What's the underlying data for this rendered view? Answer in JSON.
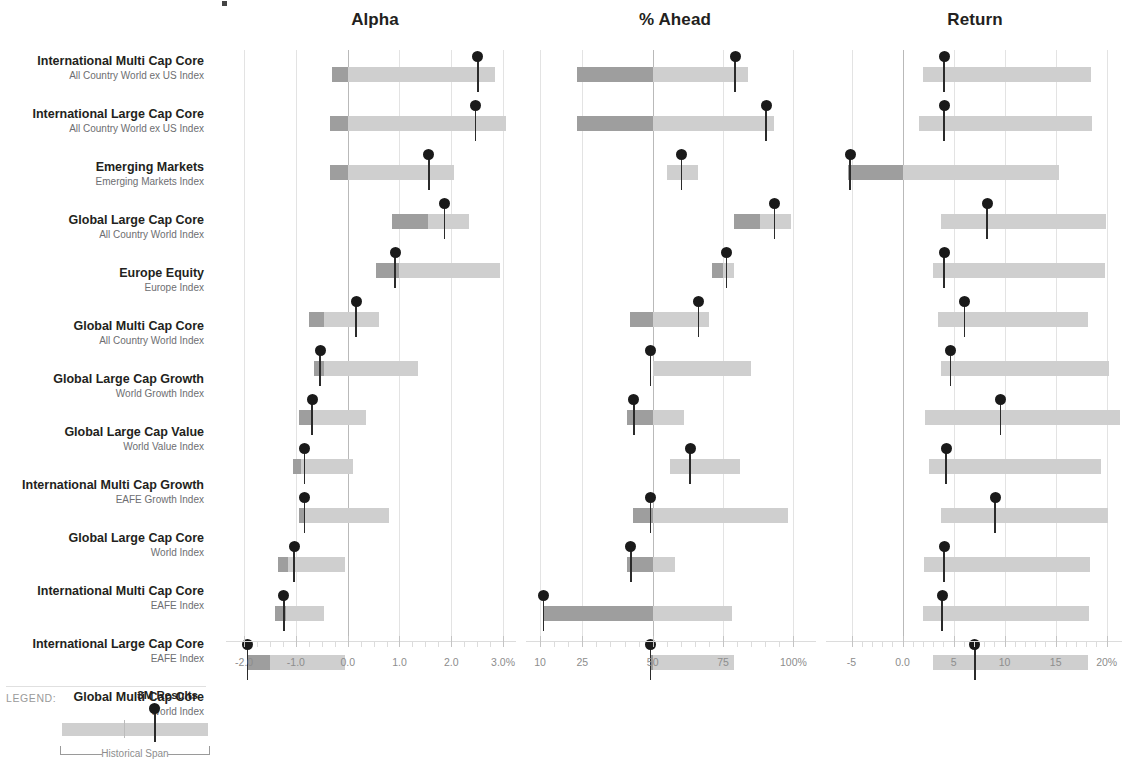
{
  "columns": [
    {
      "key": "alpha",
      "header": "Alpha",
      "unit": "%",
      "min": -2.35,
      "max": 3.25,
      "ticks": [
        {
          "v": -2.0,
          "label": "-2.0"
        },
        {
          "v": -1.0,
          "label": "-1.0"
        },
        {
          "v": 0.0,
          "label": "0.0"
        },
        {
          "v": 1.0,
          "label": "1.0"
        },
        {
          "v": 2.0,
          "label": "2.0"
        },
        {
          "v": 3.0,
          "label": "3.0%"
        }
      ],
      "reference": 0.0,
      "minor_step": 0.25
    },
    {
      "key": "ahead",
      "header": "% Ahead",
      "unit": "%",
      "min": 5,
      "max": 108,
      "ticks": [
        {
          "v": 10,
          "label": "10"
        },
        {
          "v": 25,
          "label": "25"
        },
        {
          "v": 50,
          "label": "50"
        },
        {
          "v": 75,
          "label": "75"
        },
        {
          "v": 100,
          "label": "100%"
        }
      ],
      "reference": 50,
      "minor_step": 5
    },
    {
      "key": "return",
      "header": "Return",
      "unit": "%",
      "min": -7.5,
      "max": 21.5,
      "ticks": [
        {
          "v": -5,
          "label": "-5"
        },
        {
          "v": 0,
          "label": "0.0"
        },
        {
          "v": 5,
          "label": "5"
        },
        {
          "v": 10,
          "label": "10"
        },
        {
          "v": 15,
          "label": "15"
        },
        {
          "v": 20,
          "label": "20%"
        }
      ],
      "reference": 0,
      "minor_step": 1
    }
  ],
  "rows": [
    {
      "name": "International Multi Cap Core",
      "index": "All Country World ex US Index",
      "alpha": {
        "span_low": -0.3,
        "span_high": 2.85,
        "split": 0.0,
        "marker": 2.5
      },
      "ahead": {
        "span_low": 23,
        "span_high": 84,
        "split": 50,
        "marker": 79
      },
      "return": {
        "span_low": 2.0,
        "span_high": 18.5,
        "split": 0.0,
        "marker": 4.0
      }
    },
    {
      "name": "International Large Cap Core",
      "index": "All Country World ex US Index",
      "alpha": {
        "span_low": -0.35,
        "span_high": 3.05,
        "split": 0.0,
        "marker": 2.45
      },
      "ahead": {
        "span_low": 23,
        "span_high": 93,
        "split": 50,
        "marker": 90
      },
      "return": {
        "span_low": 1.6,
        "span_high": 18.6,
        "split": 0.0,
        "marker": 4.0
      }
    },
    {
      "name": "Emerging Markets",
      "index": "Emerging Markets Index",
      "alpha": {
        "span_low": -0.35,
        "span_high": 2.05,
        "split": 0.0,
        "marker": 1.55
      },
      "ahead": {
        "span_low": 55,
        "span_high": 66,
        "split": 55,
        "marker": 60
      },
      "return": {
        "span_low": -5.3,
        "span_high": 15.3,
        "split": 0.0,
        "marker": -5.2
      }
    },
    {
      "name": "Global Large Cap Core",
      "index": "All Country World Index",
      "alpha": {
        "span_low": 0.85,
        "span_high": 2.35,
        "split": 1.55,
        "marker": 1.85
      },
      "ahead": {
        "span_low": 79,
        "span_high": 99,
        "split": 88,
        "marker": 93
      },
      "return": {
        "span_low": 3.8,
        "span_high": 19.9,
        "split": 3.8,
        "marker": 8.2
      }
    },
    {
      "name": "Europe Equity",
      "index": "Europe Index",
      "alpha": {
        "span_low": 0.55,
        "span_high": 2.95,
        "split": 1.0,
        "marker": 0.9
      },
      "ahead": {
        "span_low": 71,
        "span_high": 79,
        "split": 75,
        "marker": 76
      },
      "return": {
        "span_low": 3.0,
        "span_high": 19.8,
        "split": 3.0,
        "marker": 4.0
      }
    },
    {
      "name": "Global Multi Cap Core",
      "index": "All Country World Index",
      "alpha": {
        "span_low": -0.75,
        "span_high": 0.6,
        "split": -0.45,
        "marker": 0.15
      },
      "ahead": {
        "span_low": 42,
        "span_high": 70,
        "split": 50,
        "marker": 66
      },
      "return": {
        "span_low": 3.5,
        "span_high": 18.2,
        "split": 3.5,
        "marker": 6.0
      }
    },
    {
      "name": "Global Large Cap Growth",
      "index": "World Growth Index",
      "alpha": {
        "span_low": -0.65,
        "span_high": 1.35,
        "split": -0.45,
        "marker": -0.55
      },
      "ahead": {
        "span_low": 50,
        "span_high": 85,
        "split": 50,
        "marker": 49
      },
      "return": {
        "span_low": 3.8,
        "span_high": 20.2,
        "split": 3.8,
        "marker": 4.6
      }
    },
    {
      "name": "Global Large Cap Value",
      "index": "World Value Index",
      "alpha": {
        "span_low": -0.95,
        "span_high": 0.35,
        "split": -0.7,
        "marker": -0.7
      },
      "ahead": {
        "span_low": 41,
        "span_high": 61,
        "split": 50,
        "marker": 43
      },
      "return": {
        "span_low": 2.2,
        "span_high": 21.3,
        "split": 2.2,
        "marker": 9.5
      }
    },
    {
      "name": "International Multi Cap Growth",
      "index": "EAFE Growth Index",
      "alpha": {
        "span_low": -1.05,
        "span_high": 0.1,
        "split": -0.9,
        "marker": -0.85
      },
      "ahead": {
        "span_low": 56,
        "span_high": 81,
        "split": 56,
        "marker": 63
      },
      "return": {
        "span_low": 2.6,
        "span_high": 19.4,
        "split": 2.6,
        "marker": 4.2
      }
    },
    {
      "name": "Global Large Cap Core",
      "index": "World Index",
      "alpha": {
        "span_low": -0.95,
        "span_high": 0.8,
        "split": -0.85,
        "marker": -0.85
      },
      "ahead": {
        "span_low": 43,
        "span_high": 98,
        "split": 50,
        "marker": 49
      },
      "return": {
        "span_low": 3.8,
        "span_high": 20.1,
        "split": 3.8,
        "marker": 9.0
      }
    },
    {
      "name": "International Multi Cap Core",
      "index": "EAFE Index",
      "alpha": {
        "span_low": -1.35,
        "span_high": -0.05,
        "split": -1.15,
        "marker": -1.05
      },
      "ahead": {
        "span_low": 41,
        "span_high": 58,
        "split": 50,
        "marker": 42
      },
      "return": {
        "span_low": 2.1,
        "span_high": 18.4,
        "split": 2.1,
        "marker": 4.0
      }
    },
    {
      "name": "International Large Cap Core",
      "index": "EAFE Index",
      "alpha": {
        "span_low": -1.4,
        "span_high": -0.45,
        "split": -1.2,
        "marker": -1.25
      },
      "ahead": {
        "span_low": 11,
        "span_high": 78,
        "split": 50,
        "marker": 11
      },
      "return": {
        "span_low": 2.0,
        "span_high": 18.3,
        "split": 2.0,
        "marker": 3.8
      }
    },
    {
      "name": "Global Multi Cap Core",
      "index": "World Index",
      "alpha": {
        "span_low": -1.95,
        "span_high": -0.05,
        "split": -1.5,
        "marker": -1.95
      },
      "ahead": {
        "span_low": 49,
        "span_high": 79,
        "split": 50,
        "marker": 49
      },
      "return": {
        "span_low": 3.0,
        "span_high": 18.2,
        "split": 3.0,
        "marker": 7.0
      }
    }
  ],
  "legend": {
    "title": "LEGEND:",
    "results_label": "3M Results",
    "span_label": "Historical Span"
  },
  "colors": {
    "bar_light": "#cfcfcf",
    "bar_dark": "#9e9e9e",
    "marker": "#1a1a1a",
    "text": "#231f20",
    "muted": "#6d6e71",
    "grid": "#e3e3e3"
  },
  "chart_data": {
    "type": "bar",
    "title": "",
    "subtitle": "",
    "xlabel": "",
    "ylabel": "",
    "grid": true,
    "legend_position": "bottom-left",
    "panels": [
      "Alpha",
      "% Ahead",
      "Return"
    ],
    "categories": [
      "International Multi Cap Core / All Country World ex US Index",
      "International Large Cap Core / All Country World ex US Index",
      "Emerging Markets / Emerging Markets Index",
      "Global Large Cap Core / All Country World Index",
      "Europe Equity / Europe Index",
      "Global Multi Cap Core / All Country World Index",
      "Global Large Cap Growth / World Growth Index",
      "Global Large Cap Value / World Value Index",
      "International Multi Cap Growth / EAFE Growth Index",
      "Global Large Cap Core / World Index",
      "International Multi Cap Core / EAFE Index",
      "International Large Cap Core / EAFE Index",
      "Global Multi Cap Core / World Index"
    ],
    "series": [
      {
        "name": "Alpha 3M Results",
        "values": [
          2.5,
          2.45,
          1.55,
          1.85,
          0.9,
          0.15,
          -0.55,
          -0.7,
          -0.85,
          -0.85,
          -1.05,
          -1.25,
          -1.95
        ]
      },
      {
        "name": "Alpha Historical Span Low",
        "values": [
          -0.3,
          -0.35,
          -0.35,
          0.85,
          0.55,
          -0.75,
          -0.65,
          -0.95,
          -1.05,
          -0.95,
          -1.35,
          -1.4,
          -1.95
        ]
      },
      {
        "name": "Alpha Historical Span High",
        "values": [
          2.85,
          3.05,
          2.05,
          2.35,
          2.95,
          0.6,
          1.35,
          0.35,
          0.1,
          0.8,
          -0.05,
          -0.45,
          -0.05
        ]
      },
      {
        "name": "% Ahead 3M Results",
        "values": [
          79,
          90,
          60,
          93,
          76,
          66,
          49,
          43,
          63,
          49,
          42,
          11,
          49
        ]
      },
      {
        "name": "% Ahead Historical Span Low",
        "values": [
          23,
          23,
          55,
          79,
          71,
          42,
          50,
          41,
          56,
          43,
          41,
          11,
          49
        ]
      },
      {
        "name": "% Ahead Historical Span High",
        "values": [
          84,
          93,
          66,
          99,
          79,
          70,
          85,
          61,
          81,
          98,
          58,
          78,
          79
        ]
      },
      {
        "name": "Return 3M Results",
        "values": [
          4.0,
          4.0,
          -5.2,
          8.2,
          4.0,
          6.0,
          4.6,
          9.5,
          4.2,
          9.0,
          4.0,
          3.8,
          7.0
        ]
      },
      {
        "name": "Return Historical Span Low",
        "values": [
          2.0,
          1.6,
          -5.3,
          3.8,
          3.0,
          3.5,
          3.8,
          2.2,
          2.6,
          3.8,
          2.1,
          2.0,
          3.0
        ]
      },
      {
        "name": "Return Historical Span High",
        "values": [
          18.5,
          18.6,
          15.3,
          19.9,
          19.8,
          18.2,
          20.2,
          21.3,
          19.4,
          20.1,
          18.4,
          18.3,
          18.2
        ]
      }
    ],
    "axes": [
      {
        "panel": "Alpha",
        "range": [
          -2.35,
          3.25
        ],
        "ticks": [
          -2.0,
          -1.0,
          0.0,
          1.0,
          2.0,
          3.0
        ],
        "ticklabels": [
          "-2.0",
          "-1.0",
          "0.0",
          "1.0",
          "2.0",
          "3.0%"
        ],
        "reference": 0.0
      },
      {
        "panel": "% Ahead",
        "range": [
          5,
          108
        ],
        "ticks": [
          10,
          25,
          50,
          75,
          100
        ],
        "ticklabels": [
          "10",
          "25",
          "50",
          "75",
          "100%"
        ],
        "reference": 50
      },
      {
        "panel": "Return",
        "range": [
          -7.5,
          21.5
        ],
        "ticks": [
          -5,
          0,
          5,
          10,
          15,
          20
        ],
        "ticklabels": [
          "-5",
          "0.0",
          "5",
          "10",
          "15",
          "20%"
        ],
        "reference": 0
      }
    ]
  }
}
